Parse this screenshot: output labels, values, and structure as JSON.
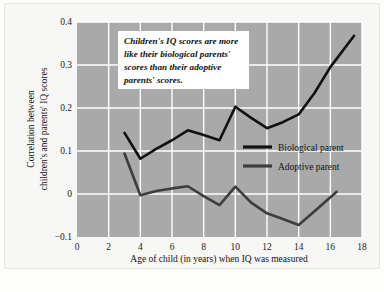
{
  "chart_data": {
    "type": "line",
    "title": "",
    "xlabel": "Age of child (in years) when IQ was measured",
    "ylabel": "Correlation between children's and parents' IQ scores",
    "xlim": [
      0,
      18
    ],
    "ylim": [
      -0.1,
      0.4
    ],
    "xticks": [
      0,
      2,
      4,
      6,
      8,
      10,
      12,
      14,
      16,
      18
    ],
    "xtick_labels": [
      "0",
      "2",
      "4",
      "6",
      "8",
      "10",
      "12",
      "14",
      "16",
      "18"
    ],
    "yticks": [
      -0.1,
      0,
      0.1,
      0.2,
      0.3,
      0.4
    ],
    "ytick_labels": [
      "−0.1",
      "0",
      "0.1",
      "0.2",
      "0.3",
      "0.4"
    ],
    "grid": true,
    "grid_color": "#ffffff",
    "plot_background": "#a9a9a9",
    "legend_position": "center-right",
    "series": [
      {
        "name": "Biological parent",
        "color": "#111111",
        "x": [
          3,
          4,
          5,
          6,
          7,
          8,
          9,
          10,
          11,
          12,
          13,
          14,
          15,
          16,
          17.5
        ],
        "y": [
          0.142,
          0.082,
          0.105,
          0.125,
          0.148,
          0.137,
          0.125,
          0.203,
          0.177,
          0.153,
          0.167,
          0.185,
          0.235,
          0.295,
          0.368
        ]
      },
      {
        "name": "Adoptive parent",
        "color": "#3d3d3d",
        "x": [
          3,
          4,
          5,
          6,
          7,
          8,
          9,
          10,
          11,
          12,
          13,
          14,
          15,
          16.4
        ],
        "y": [
          0.094,
          -0.003,
          0.007,
          0.013,
          0.018,
          -0.005,
          -0.026,
          0.017,
          -0.02,
          -0.045,
          -0.058,
          -0.072,
          -0.04,
          0.005
        ]
      }
    ],
    "annotations": [
      {
        "name": "callout",
        "text": "Children's IQ scores are more like their biological parents' scores than their adoptive parents' scores.",
        "lines": [
          "Children's IQ scores are more",
          "like their biological parents'",
          "scores than their adoptive",
          "parents' scores."
        ],
        "background": "#ffffff"
      }
    ]
  }
}
